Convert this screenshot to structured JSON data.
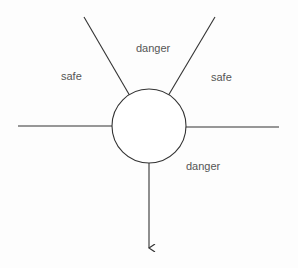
{
  "diagram": {
    "labels": {
      "top_danger": "danger",
      "left_safe": "safe",
      "right_safe": "safe",
      "bottom_danger": "danger"
    },
    "colors": {
      "stroke": "#333333",
      "text": "#555555",
      "background": "#fdfdfd"
    }
  }
}
